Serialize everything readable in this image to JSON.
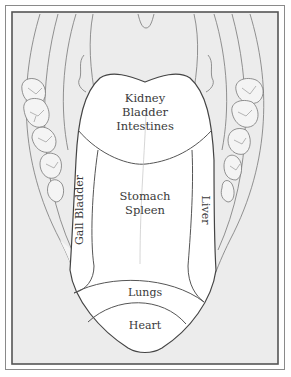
{
  "diagram": {
    "type": "tongue-map",
    "colors": {
      "stroke": "#4a4a4a",
      "background_tissue": "#ececec",
      "tongue_fill": "#ffffff",
      "text": "#3a3a3a"
    },
    "zones": {
      "tip_back": {
        "lines": [
          "Kidney",
          "Bladder",
          "Intestines"
        ]
      },
      "center": {
        "lines": [
          "Stomach",
          "Spleen"
        ]
      },
      "left_side": {
        "label": "Gall Bladder",
        "orientation": "vertical-bottom-to-top"
      },
      "right_side": {
        "label": "Liver",
        "orientation": "vertical-top-to-bottom"
      },
      "front_upper": {
        "label": "Lungs"
      },
      "front_tip": {
        "label": "Heart"
      }
    }
  }
}
